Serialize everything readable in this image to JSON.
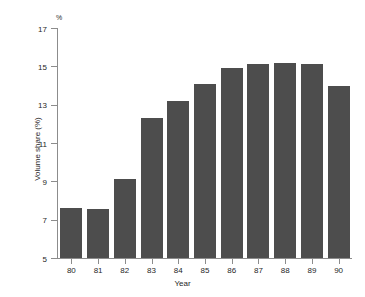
{
  "chart_data": {
    "type": "bar",
    "title": "",
    "subtitle": "",
    "xlabel": "Year",
    "ylabel": "Volume share (%)",
    "unit_label": "%",
    "categories": [
      "80",
      "81",
      "82",
      "83",
      "84",
      "85",
      "86",
      "87",
      "88",
      "89",
      "90"
    ],
    "values": [
      7.6,
      7.55,
      9.1,
      12.3,
      13.2,
      14.1,
      14.9,
      15.1,
      15.2,
      15.1,
      14.0
    ],
    "ylim": [
      5,
      17
    ],
    "yticks": [
      5,
      7,
      9,
      11,
      13,
      15,
      17
    ],
    "ytick_labels": [
      "5",
      "7",
      "9",
      "11",
      "13",
      "15",
      "17"
    ],
    "grid": false,
    "legend": "none",
    "bar_color": "#4d4d4d",
    "axis_color": "#8c8c8c",
    "background_color": "#ffffff"
  }
}
